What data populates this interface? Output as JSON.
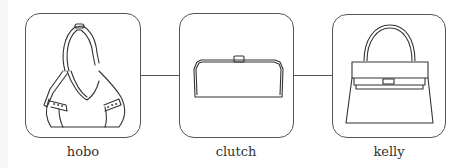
{
  "diagram": {
    "nodes": [
      {
        "id": "hobo",
        "label": "hobo",
        "icon": "hobo-bag-icon"
      },
      {
        "id": "clutch",
        "label": "clutch",
        "icon": "clutch-bag-icon"
      },
      {
        "id": "kelly",
        "label": "kelly",
        "icon": "kelly-bag-icon"
      }
    ],
    "edges": [
      {
        "from": "hobo",
        "to": "clutch"
      },
      {
        "from": "clutch",
        "to": "kelly"
      }
    ],
    "colors": {
      "stroke": "#555555",
      "background": "#ffffff",
      "text": "#333333"
    }
  }
}
